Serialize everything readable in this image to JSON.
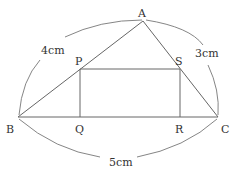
{
  "points": {
    "A": {
      "label": "A",
      "x": 143,
      "y": 21
    },
    "B": {
      "label": "B",
      "x": 18,
      "y": 117
    },
    "C": {
      "label": "C",
      "x": 218,
      "y": 117
    },
    "P": {
      "label": "P",
      "x": 80,
      "y": 69
    },
    "S": {
      "label": "S",
      "x": 180,
      "y": 69
    },
    "Q": {
      "label": "Q",
      "x": 80,
      "y": 117
    },
    "R": {
      "label": "R",
      "x": 180,
      "y": 117
    }
  },
  "measurements": {
    "AB": "4cm",
    "AC": "3cm",
    "BC": "5cm"
  }
}
